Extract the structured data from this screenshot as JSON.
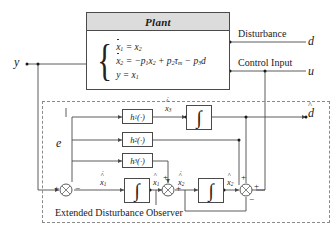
{
  "figure": {
    "type": "control-block-diagram"
  },
  "plant": {
    "title": "Plant",
    "equations": [
      {
        "lhs": "x",
        "lhs_sub": "1",
        "lhs_dot": true,
        "text": "= x₂"
      },
      {
        "lhs": "x",
        "lhs_sub": "2",
        "lhs_dot": true,
        "text": "= −p₁x₂ + p₂τₘ − p₃d"
      },
      {
        "lhs": "y",
        "lhs_sub": "",
        "lhs_dot": false,
        "text": "= x₁"
      }
    ],
    "eq1_lhs": "x",
    "eq1_rhs": "= x",
    "eq1_rhs_sub": "2",
    "eq2_lhs": "x",
    "eq2_rhs_a": "= −p",
    "eq2_rhs_b": "x",
    "eq2_rhs_c": "+ p",
    "eq2_rhs_d": "τ",
    "eq2_rhs_e": "− p",
    "eq2_rhs_f": "d",
    "eq3_lhs": "y",
    "eq3_rhs": "= x",
    "eq3_rhs_sub": "1"
  },
  "signals": {
    "output_y": "y",
    "disturbance_label": "Disturbance",
    "disturbance_var": "d",
    "control_input_label": "Control Input",
    "control_input_var": "u",
    "error_e": "e",
    "d_hat": "d",
    "x1_hat_dot": "x",
    "x1_hat": "x",
    "x2_hat_dot": "x",
    "x2_hat": "x",
    "d_hat_dot": "x",
    "sub1": "1",
    "sub2": "2",
    "sub3": "3"
  },
  "gains": [
    {
      "name": "h1",
      "base": "h",
      "sub": "1",
      "arg": "(·)"
    },
    {
      "name": "h2",
      "base": "h",
      "sub": "2",
      "arg": "(·)"
    },
    {
      "name": "h3",
      "base": "h",
      "sub": "3",
      "arg": "(·)"
    }
  ],
  "integrators": [
    {
      "name": "integrator-d",
      "glyph": "∫"
    },
    {
      "name": "integrator-x1",
      "glyph": "∫"
    },
    {
      "name": "integrator-x2",
      "glyph": "∫"
    }
  ],
  "summing_junctions": [
    {
      "name": "sum-error",
      "left": "+",
      "right": "−"
    },
    {
      "name": "sum-mid",
      "left": "+",
      "right": "+"
    },
    {
      "name": "sum-right",
      "top": "+",
      "right": "+",
      "bottom": "−"
    }
  ],
  "observer": {
    "caption": "Extended Disturbance Observer"
  },
  "colors": {
    "line": "#4a4a4a",
    "dashed": "#8a8a8a",
    "header_fill": "#dcdcdc",
    "text": "#1a1a1a",
    "background": "#ffffff"
  }
}
